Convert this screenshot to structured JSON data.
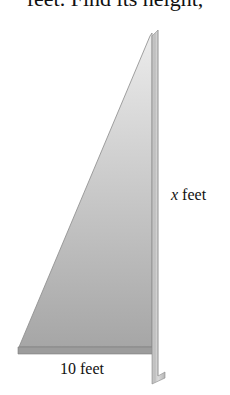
{
  "problem_text_fragment": "feet. Find its height,",
  "figure": {
    "type": "right-triangle",
    "labels": {
      "height_variable": "x",
      "height_unit": "feet",
      "base": "10 feet"
    },
    "colors": {
      "triangle_fill_top": "#e8e8e8",
      "triangle_fill_bottom": "#a8a8a8",
      "strip": "#c8c8c8",
      "base_strip": "#9a9a9a",
      "text": "#111111"
    }
  }
}
